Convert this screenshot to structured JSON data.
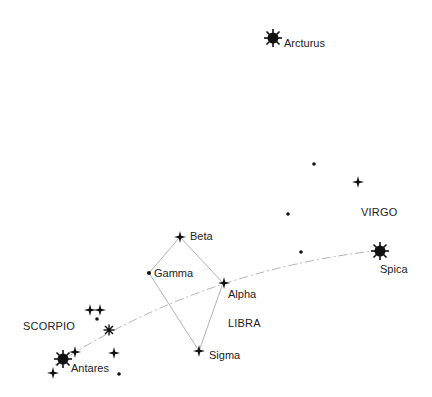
{
  "colors": {
    "ink": "#111111",
    "line": "#aaaaaa",
    "ecliptic": "#aaaaaa",
    "background": "#ffffff"
  },
  "constellations": {
    "virgo": "VIRGO",
    "libra": "LIBRA",
    "scorpio": "SCORPIO"
  },
  "stars": {
    "arcturus": {
      "label": "Arcturus",
      "type": "bright"
    },
    "spica": {
      "label": "Spica",
      "type": "bright"
    },
    "antares": {
      "label": "Antares",
      "type": "bright"
    },
    "beta": {
      "label": "Beta",
      "type": "cross"
    },
    "gamma": {
      "label": "Gamma",
      "type": "dot"
    },
    "alpha": {
      "label": "Alpha",
      "type": "cross"
    },
    "sigma": {
      "label": "Sigma",
      "type": "cross"
    }
  },
  "ecliptic": {
    "style": "dash-dot"
  }
}
